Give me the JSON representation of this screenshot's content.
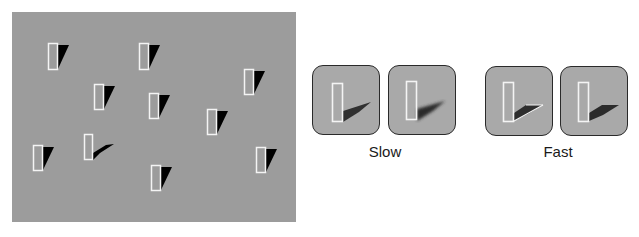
{
  "figure": {
    "search_display": {
      "background": "#9c9c9c",
      "items_description": "Vertical white-outlined rectangles with black cast shadows; one odd item has a long flat shadow",
      "distractor_count": 9,
      "target_count": 1
    },
    "groups": [
      {
        "label": "Slow",
        "panels": 2,
        "shadow_color": "#333333"
      },
      {
        "label": "Fast",
        "panels": 2,
        "shadow_color": "#2b2b2b"
      }
    ],
    "colors": {
      "panel_fill": "#a9a9a9",
      "outline": "#ffffff",
      "shadow": "#000000"
    }
  }
}
